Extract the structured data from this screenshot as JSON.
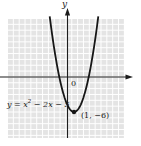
{
  "figure": {
    "y_axis_label": "y",
    "origin_label": "0",
    "equation": {
      "part1": "y = x",
      "sup": "2",
      "part2": " − 2x − 5"
    },
    "vertex_label": "(1, −6)",
    "colors": {
      "curve": "#161616",
      "axis": "#1c1c1c",
      "text": "#1a1a1a",
      "grid_cell": "#e4e4e4",
      "grid_line": "#ffffff"
    }
  },
  "chart_data": {
    "type": "line",
    "equation": "y = x^2 - 2x - 5",
    "coefficients": [
      1,
      -2,
      -5
    ],
    "vertex": [
      1,
      -6
    ],
    "y_intercept": -5,
    "x_intercepts": [
      -1.449,
      3.449
    ],
    "x_range": [
      -3.05,
      5.05
    ],
    "points": [
      [
        -3,
        10
      ],
      [
        -2,
        3
      ],
      [
        -1,
        -2
      ],
      [
        0,
        -5
      ],
      [
        1,
        -6
      ],
      [
        2,
        -5
      ],
      [
        3,
        -2
      ],
      [
        4,
        3
      ],
      [
        5,
        10
      ]
    ],
    "axes": {
      "grid": true,
      "units_per_cell": 1,
      "x_arrow": "right",
      "y_arrow": "up",
      "origin_label": "0"
    }
  }
}
